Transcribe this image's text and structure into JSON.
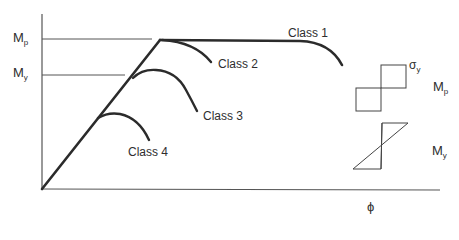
{
  "diagram": {
    "axes": {
      "y_ticks": [
        {
          "main": "M",
          "sub": "p"
        },
        {
          "main": "M",
          "sub": "y"
        }
      ],
      "x_label": "ϕ"
    },
    "curves": [
      {
        "label": "Class 1"
      },
      {
        "label": "Class 2"
      },
      {
        "label": "Class 3"
      },
      {
        "label": "Class 4"
      }
    ],
    "stress_blocks": [
      {
        "moment": {
          "main": "M",
          "sub": "p"
        },
        "stress": {
          "main": "σ",
          "sub": "y"
        },
        "shape": "rectangular-plastic"
      },
      {
        "moment": {
          "main": "M",
          "sub": "y"
        },
        "shape": "triangular-elastic"
      }
    ],
    "colors": {
      "line": "#2b2b2b",
      "thin": "#555555",
      "background": "#ffffff"
    }
  }
}
